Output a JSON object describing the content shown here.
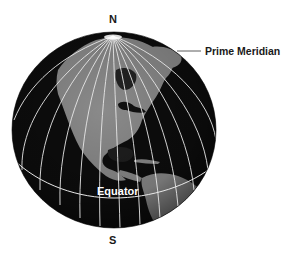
{
  "diagram": {
    "labels": {
      "north": "N",
      "south": "S",
      "prime_meridian": "Prime Meridian",
      "equator": "Equator"
    },
    "colors": {
      "background": "#ffffff",
      "ocean": "#0d0d0d",
      "land": "#8a8a8a",
      "grid_lines": "#e8e8e8",
      "label_text": "#1a1a1a"
    },
    "elements": [
      "globe",
      "meridian-lines",
      "equator-line",
      "prime-meridian-leader-line",
      "north-pole-marker",
      "continents: North America, Central America, northern South America, Greenland"
    ]
  }
}
